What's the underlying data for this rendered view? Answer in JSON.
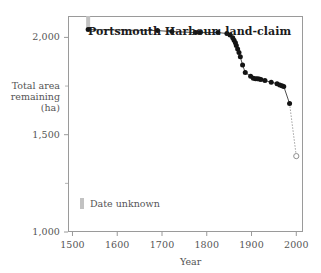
{
  "chart_data": {
    "type": "line",
    "title": "Portsmouth Harbour: land-claim",
    "xlabel": "Year",
    "ylabel": "Total area remaining (ha)",
    "ylabel_lines": [
      "Total area",
      "remaining",
      "(ha)"
    ],
    "xlim": [
      1490,
      2015
    ],
    "ylim": [
      1000,
      2110
    ],
    "xticks": [
      1500,
      1600,
      1700,
      1800,
      1900,
      2000
    ],
    "xtick_labels": [
      "1500",
      "1600",
      "1700",
      "1800",
      "1900",
      "2000"
    ],
    "yticks": [
      1000,
      1500,
      2000
    ],
    "ytick_labels": [
      "1,000",
      "1,500",
      "2,000"
    ],
    "yticks_minor": [
      1250,
      1750
    ],
    "grid": false,
    "legend_position": "inside-lower-left",
    "legend": [
      {
        "label": "Date unknown",
        "marker": "vertical-bar",
        "color": "#c2c2c2"
      }
    ],
    "series": [
      {
        "name": "Total area remaining",
        "marker": "filled-circle",
        "color": "#141414",
        "line_color": "#3a3a3a",
        "x": [
          1535,
          1690,
          1722,
          1775,
          1785,
          1825,
          1845,
          1852,
          1858,
          1861,
          1864,
          1866,
          1869,
          1872,
          1875,
          1880,
          1886,
          1898,
          1904,
          1909,
          1913,
          1917,
          1921,
          1930,
          1944,
          1957,
          1963,
          1968,
          1972,
          1985
        ],
        "y": [
          2040,
          2035,
          2030,
          2025,
          2025,
          2025,
          2020,
          2012,
          1998,
          1985,
          1972,
          1958,
          1940,
          1922,
          1900,
          1858,
          1820,
          1800,
          1790,
          1788,
          1788,
          1786,
          1784,
          1778,
          1770,
          1762,
          1756,
          1752,
          1748,
          1660
        ]
      }
    ],
    "projected_segment": {
      "style": "dotted",
      "from": {
        "x": 1985,
        "y": 1660
      },
      "to": {
        "x": 2000,
        "y": 1390
      },
      "endpoint_marker": "open-circle",
      "color": "#9a9a9a"
    },
    "annotations": [
      {
        "name": "date-unknown-bar",
        "x": 1535,
        "y_from": 2040,
        "y_to": 2110,
        "color": "#c2c2c2",
        "note": "Date unknown"
      }
    ]
  }
}
